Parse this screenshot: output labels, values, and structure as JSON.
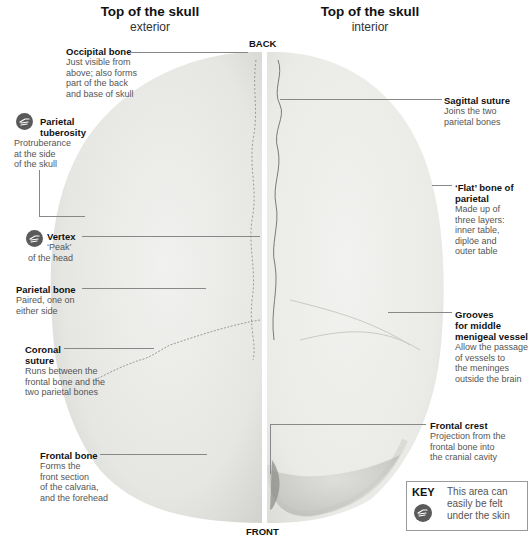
{
  "headers": {
    "left": {
      "title": "Top of the skull",
      "subtitle": "exterior"
    },
    "right": {
      "title": "Top of the skull",
      "subtitle": "interior"
    }
  },
  "directions": {
    "back": "BACK",
    "front": "FRONT"
  },
  "labels_left": [
    {
      "id": "occipital-bone",
      "title": "Occipital bone",
      "body": [
        "Just visible from",
        "above; also forms",
        "part of the back",
        "and base of skull"
      ],
      "palpable": false
    },
    {
      "id": "parietal-tuberosity",
      "title": [
        "Parietal",
        "tuberosity"
      ],
      "body": [
        "Protruberance",
        "at the side",
        "of the skull"
      ],
      "palpable": true
    },
    {
      "id": "vertex",
      "title": "Vertex",
      "body": [
        "‘Peak’",
        "of the head"
      ],
      "palpable": true
    },
    {
      "id": "parietal-bone",
      "title": "Parietal bone",
      "body": [
        "Paired, one on",
        "either side"
      ],
      "palpable": false
    },
    {
      "id": "coronal-suture",
      "title": [
        "Coronal",
        "suture"
      ],
      "body": [
        "Runs between the",
        "frontal bone and the",
        "two parietal bones"
      ],
      "palpable": false
    },
    {
      "id": "frontal-bone",
      "title": "Frontal bone",
      "body": [
        "Forms the",
        "front section",
        "of the calvaria,",
        "and the forehead"
      ],
      "palpable": false
    }
  ],
  "labels_right": [
    {
      "id": "sagittal-suture",
      "title": "Sagittal suture",
      "body": [
        "Joins the two",
        "parietal bones"
      ]
    },
    {
      "id": "flat-bone-of-parietal",
      "title": [
        "‘Flat’ bone of",
        "parietal"
      ],
      "body": [
        "Made up of",
        "three layers:",
        "inner table,",
        "diplöe and",
        "outer table"
      ]
    },
    {
      "id": "grooves-middle-meningeal",
      "title": [
        "Grooves",
        "for middle",
        "menigeal vessel"
      ],
      "body": [
        "Allow the passage",
        "of vessels to",
        "the meninges",
        "outside the brain"
      ]
    },
    {
      "id": "frontal-crest",
      "title": "Frontal crest",
      "body": [
        "Projection from the",
        "frontal bone into",
        "the cranial cavity"
      ]
    }
  ],
  "key": {
    "heading": "KEY",
    "icon": "palpable-hand-icon",
    "text": [
      "This area can",
      "easily be felt",
      "under the skin"
    ]
  },
  "colors": {
    "bone_exterior": "#e9e9e7",
    "bone_interior": "#ededeb",
    "bone_rim": "#d8d8d5",
    "leader_line": "#888888",
    "icon_fill": "#5a5a5a",
    "label_title": "#111111",
    "label_body": "#555555"
  }
}
